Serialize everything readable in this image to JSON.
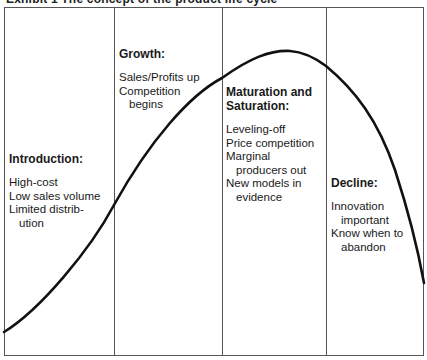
{
  "title": "Exhibit 1 The concept of the product life cycle",
  "stages": [
    {
      "heading": "Introduction:",
      "lines": [
        "High-cost",
        "Low sales volume",
        "Limited distrib-",
        "ution"
      ]
    },
    {
      "heading": "Growth:",
      "lines": [
        "Sales/Profits up",
        "Competition",
        "begins"
      ]
    },
    {
      "heading_lines": [
        "Maturation and",
        "Saturation:"
      ],
      "lines": [
        "Leveling-off",
        "Price competition",
        "Marginal",
        "producers out",
        "New models in",
        "evidence"
      ]
    },
    {
      "heading": "Decline:",
      "lines": [
        "Innovation",
        "important",
        "Know when to",
        "abandon"
      ]
    }
  ],
  "colors": {
    "curve": "#111111",
    "frame": "#555555",
    "text": "#1a1a1a"
  }
}
